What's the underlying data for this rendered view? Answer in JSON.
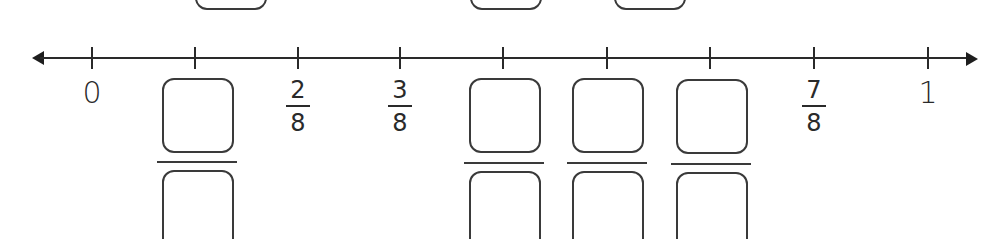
{
  "number_line": {
    "start_label": "0",
    "end_label": "1",
    "ticks": [
      {
        "position": 0,
        "x": 92,
        "label_type": "whole",
        "label": "0"
      },
      {
        "position": 1,
        "x": 195,
        "label_type": "blank"
      },
      {
        "position": 2,
        "x": 298,
        "label_type": "fraction",
        "numerator": "2",
        "denominator": "8"
      },
      {
        "position": 3,
        "x": 400,
        "label_type": "fraction",
        "numerator": "3",
        "denominator": "8"
      },
      {
        "position": 4,
        "x": 503,
        "label_type": "blank"
      },
      {
        "position": 5,
        "x": 607,
        "label_type": "blank"
      },
      {
        "position": 6,
        "x": 710,
        "label_type": "blank"
      },
      {
        "position": 7,
        "x": 814,
        "label_type": "fraction",
        "numerator": "7",
        "denominator": "8"
      },
      {
        "position": 8,
        "x": 928,
        "label_type": "whole",
        "label": "1"
      }
    ],
    "labels": {
      "zero": "0",
      "one": "1",
      "two_eighths": {
        "numerator": "2",
        "denominator": "8"
      },
      "three_eighths": {
        "numerator": "3",
        "denominator": "8"
      },
      "seven_eighths": {
        "numerator": "7",
        "denominator": "8"
      }
    },
    "blank_fraction_positions": [
      "1/8",
      "4/8",
      "5/8",
      "6/8"
    ]
  },
  "colors": {
    "line": "#2a2a2a",
    "box_border": "#3a3a3a",
    "background": "#ffffff"
  }
}
